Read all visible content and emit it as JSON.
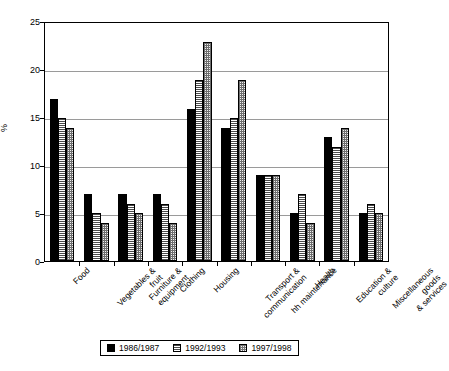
{
  "chart_data": {
    "type": "bar",
    "title": "",
    "xlabel": "",
    "ylabel": "%",
    "ylim": [
      0,
      25
    ],
    "yticks": [
      0,
      5,
      10,
      15,
      20,
      25
    ],
    "grid": true,
    "legend_position": "bottom",
    "categories": [
      "Food",
      "Vegetables &\nfruit",
      "Furniture &\nequipment",
      "Clothing",
      "Housing",
      "Transport &\ncommunication",
      "hh maintenance",
      "Health",
      "Education &\nculture",
      "Miscellaneous goods\n& services"
    ],
    "series": [
      {
        "name": "1986/1987",
        "pattern": "solid-black",
        "values": [
          17,
          7,
          7,
          7,
          16,
          14,
          9,
          5,
          13,
          5
        ]
      },
      {
        "name": "1992/1993",
        "pattern": "horizontal-lines",
        "values": [
          15,
          5,
          6,
          6,
          19,
          15,
          9,
          7,
          12,
          6
        ]
      },
      {
        "name": "1997/1998",
        "pattern": "dotted-grid",
        "values": [
          14,
          4,
          5,
          4,
          23,
          19,
          9,
          4,
          14,
          5
        ]
      }
    ]
  }
}
